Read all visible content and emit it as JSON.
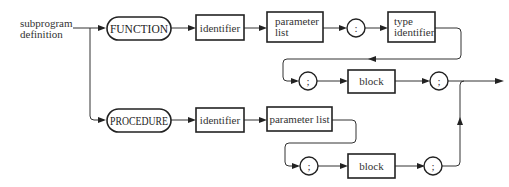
{
  "diagram": {
    "type": "syntax-diagram",
    "start_label": {
      "line1": "subprogram",
      "line2": "definition"
    },
    "function_path": {
      "keyword": "FUNCTION",
      "identifier": "identifier",
      "parameter_list": {
        "line1": "parameter",
        "line2": "list"
      },
      "colon": ":",
      "type_identifier": {
        "line1": "type",
        "line2": "identifier"
      },
      "semicolon_before_block": ";",
      "block": "block",
      "semicolon_after_block": ";"
    },
    "procedure_path": {
      "keyword": "PROCEDURE",
      "identifier": "identifier",
      "parameter_list": "parameter list",
      "semicolon_before_block": ";",
      "block": "block",
      "semicolon_after_block": ";"
    },
    "colors": {
      "stroke": "#222222",
      "text": "#333333",
      "background": "#ffffff"
    }
  }
}
